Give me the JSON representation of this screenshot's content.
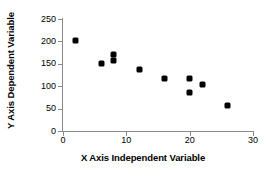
{
  "chart_data": {
    "type": "scatter",
    "title": "",
    "xlabel": "X Axis Independent Variable",
    "ylabel": "Y Axis Dependent Variable",
    "xlim": [
      0,
      30
    ],
    "ylim": [
      0,
      250
    ],
    "xticks": [
      0,
      10,
      20,
      30
    ],
    "yticks": [
      0,
      50,
      100,
      150,
      200,
      250
    ],
    "xtick_labels": [
      "0",
      "10",
      "20",
      "30"
    ],
    "ytick_labels": [
      "0",
      "50",
      "100",
      "150",
      "200",
      "250"
    ],
    "grid": false,
    "legend": null,
    "marker": "diamond",
    "marker_color": "#000000",
    "axis_color": "#8a8a8a",
    "background": "#ffffff",
    "series": [
      {
        "name": "observations",
        "points": [
          {
            "x": 2,
            "y": 203
          },
          {
            "x": 6,
            "y": 150
          },
          {
            "x": 8,
            "y": 171
          },
          {
            "x": 8,
            "y": 157
          },
          {
            "x": 12,
            "y": 137
          },
          {
            "x": 16,
            "y": 117
          },
          {
            "x": 20,
            "y": 117
          },
          {
            "x": 20,
            "y": 87
          },
          {
            "x": 22,
            "y": 104
          },
          {
            "x": 26,
            "y": 56
          }
        ]
      }
    ]
  }
}
